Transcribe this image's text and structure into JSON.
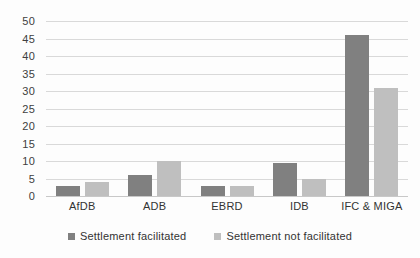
{
  "chart_data": {
    "type": "bar",
    "title": "",
    "subtitle": "",
    "xlabel": "",
    "ylabel": "",
    "ylim": [
      0,
      50
    ],
    "ytick_step": 5,
    "yticks": [
      "50",
      "45",
      "40",
      "35",
      "30",
      "25",
      "20",
      "15",
      "10",
      "5",
      "0"
    ],
    "grid": true,
    "legend_position": "bottom",
    "categories": [
      "AfDB",
      "ADB",
      "EBRD",
      "IDB",
      "IFC & MIGA"
    ],
    "series": [
      {
        "name": "Settlement facilitated",
        "color": "#808080",
        "values": [
          3,
          6,
          3,
          9.5,
          46
        ]
      },
      {
        "name": "Settlement not facilitated",
        "color": "#bfbfbf",
        "values": [
          4,
          10,
          3,
          5,
          31
        ]
      }
    ]
  }
}
